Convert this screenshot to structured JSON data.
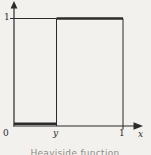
{
  "figure": {
    "caption": "Heaviside function",
    "labels": {
      "y_tick_1": "1",
      "origin": "0",
      "step": "y",
      "x_tick_1": "1",
      "x_axis": "x"
    }
  },
  "chart_data": {
    "type": "line",
    "title": "Heaviside function",
    "xlabel": "x",
    "ylabel": "",
    "xlim": [
      0,
      1.28
    ],
    "ylim": [
      0,
      1.16
    ],
    "grid": false,
    "legend": "none",
    "x_ticks": [
      {
        "value": 0,
        "label": "0"
      },
      {
        "value": 0.39,
        "label": "y"
      },
      {
        "value": 1,
        "label": "1"
      }
    ],
    "y_ticks": [
      {
        "value": 1,
        "label": "1"
      }
    ],
    "step_x": 0.39,
    "series": [
      {
        "name": "H(x - y)",
        "segments": [
          {
            "x": [
              0,
              0.39
            ],
            "y": [
              0,
              0
            ],
            "weight": "thick"
          },
          {
            "x": [
              0.39,
              0.39
            ],
            "y": [
              0,
              1
            ],
            "weight": "thin"
          },
          {
            "x": [
              0.39,
              1
            ],
            "y": [
              1,
              1
            ],
            "weight": "thick"
          },
          {
            "x": [
              1,
              1
            ],
            "y": [
              1,
              0
            ],
            "weight": "thin"
          }
        ]
      }
    ],
    "reference_lines": [
      {
        "x": [
          0,
          0.39
        ],
        "y": [
          1,
          1
        ],
        "weight": "thin"
      }
    ],
    "colors": {
      "line": "#2b2b2b",
      "caption": "#8f8c86",
      "background": "#f2f1ed"
    }
  }
}
